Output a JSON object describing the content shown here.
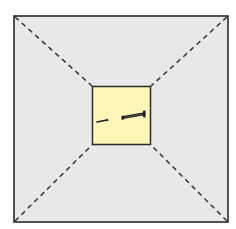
{
  "diagram": {
    "colors": {
      "background": "#ffffff",
      "outer_fill": "#e8e8e8",
      "inner_fill": "#fdf6b9",
      "stroke": "#2a2a2a",
      "nail": "#1e1e1e"
    },
    "outer_square": {
      "x": 13,
      "y": 15,
      "width": 215,
      "height": 207
    },
    "inner_square": {
      "x": 92,
      "y": 86,
      "width": 59,
      "height": 59
    },
    "objects": [
      {
        "name": "small-nail",
        "type": "nail"
      },
      {
        "name": "large-nail",
        "type": "nail"
      }
    ]
  }
}
